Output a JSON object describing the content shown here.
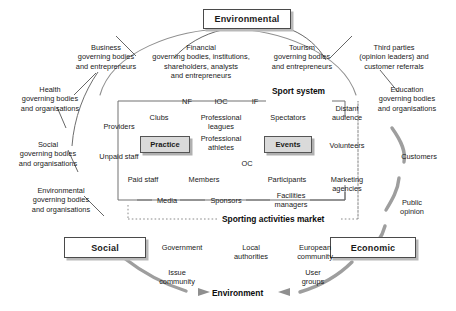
{
  "diagram": {
    "title_hidden": "Sport system stakeholder map",
    "corner_nodes": [
      {
        "id": "environmental",
        "label": "Environmental"
      },
      {
        "id": "social",
        "label": "Social"
      },
      {
        "id": "economic",
        "label": "Economic"
      }
    ],
    "section_labels": {
      "sport_system": "Sport system",
      "sporting_market": "Sporting activities market",
      "environment": "Environment"
    },
    "inner_boxes": [
      {
        "id": "practice",
        "label": "Practice"
      },
      {
        "id": "events",
        "label": "Events"
      }
    ],
    "outer_ring": [
      {
        "id": "business",
        "label": "Business\ngoverning bodies\nand entrepreneurs"
      },
      {
        "id": "financial",
        "label": "Financial\ngoverning bodies, institutions,\nshareholders, analysts\nand entrepreneurs"
      },
      {
        "id": "tourism",
        "label": "Tourism\ngoverning bodies\nand entrepreneurs"
      },
      {
        "id": "third-parties",
        "label": "Third parties\n(opinion leaders) and\ncustomer referrals"
      },
      {
        "id": "health",
        "label": "Health\ngoverning bodies\nand organisations"
      },
      {
        "id": "social-gb",
        "label": "Social\ngoverning bodies\nand organisations"
      },
      {
        "id": "environmental-gb",
        "label": "Environmental\ngoverning bodies\nand organisations"
      },
      {
        "id": "education",
        "label": "Education\ngoverning bodies\nand organisations"
      },
      {
        "id": "customers",
        "label": "Customers"
      },
      {
        "id": "public-opinion",
        "label": "Public\nopinion"
      },
      {
        "id": "government",
        "label": "Government"
      },
      {
        "id": "local-authorities",
        "label": "Local\nauthorities"
      },
      {
        "id": "european-community",
        "label": "European\ncommunity"
      },
      {
        "id": "issue-community",
        "label": "Issue\ncommunity"
      },
      {
        "id": "user-groups",
        "label": "User\ngroups"
      }
    ],
    "inner_nodes": [
      {
        "id": "nf",
        "label": "NF"
      },
      {
        "id": "ioc",
        "label": "IOC"
      },
      {
        "id": "if",
        "label": "IF"
      },
      {
        "id": "clubs",
        "label": "Clubs"
      },
      {
        "id": "professional-leagues",
        "label": "Professional\nleagues"
      },
      {
        "id": "spectators",
        "label": "Spectators"
      },
      {
        "id": "providers",
        "label": "Providers"
      },
      {
        "id": "professional-athletes",
        "label": "Professional\nathletes"
      },
      {
        "id": "unpaid-staff",
        "label": "Unpaid staff"
      },
      {
        "id": "oc",
        "label": "OC"
      },
      {
        "id": "paid-staff",
        "label": "Paid staff"
      },
      {
        "id": "members",
        "label": "Members"
      },
      {
        "id": "participants",
        "label": "Participants"
      },
      {
        "id": "media",
        "label": "Media"
      },
      {
        "id": "sponsors",
        "label": "Sponsors"
      },
      {
        "id": "facilities-managers",
        "label": "Facilities\nmanagers"
      },
      {
        "id": "distant-audience",
        "label": "Distant\naudience"
      },
      {
        "id": "volunteers",
        "label": "Volunteers"
      },
      {
        "id": "marketing-agencies",
        "label": "Marketing\nagencies"
      }
    ],
    "colors": {
      "line": "#4a4a4a",
      "arc": "#9a9a9a",
      "box_fill": "#dadada",
      "shadow": "#b9b9b9",
      "background": "#ffffff"
    }
  }
}
